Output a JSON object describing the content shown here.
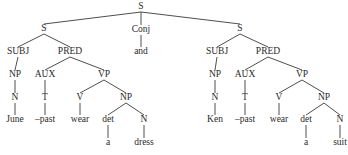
{
  "nodes": [
    {
      "id": "root",
      "label": "S",
      "x": 141,
      "y": 7
    },
    {
      "id": "s1",
      "label": "S",
      "x": 44,
      "y": 29
    },
    {
      "id": "conj",
      "label": "Conj",
      "x": 141,
      "y": 30
    },
    {
      "id": "and",
      "label": "and",
      "x": 141,
      "y": 52
    },
    {
      "id": "s2",
      "label": "S",
      "x": 240,
      "y": 29
    },
    {
      "id": "subj1",
      "label": "SUBJ",
      "x": 18,
      "y": 52
    },
    {
      "id": "pred1",
      "label": "PRED",
      "x": 70,
      "y": 52
    },
    {
      "id": "np1",
      "label": "NP",
      "x": 15,
      "y": 75
    },
    {
      "id": "aux1",
      "label": "AUX",
      "x": 45,
      "y": 75
    },
    {
      "id": "vp1",
      "label": "VP",
      "x": 104,
      "y": 75
    },
    {
      "id": "n1",
      "label": "N",
      "x": 15,
      "y": 98
    },
    {
      "id": "t1",
      "label": "T",
      "x": 45,
      "y": 98
    },
    {
      "id": "v1",
      "label": "V",
      "x": 80,
      "y": 98
    },
    {
      "id": "np1b",
      "label": "NP",
      "x": 126,
      "y": 98
    },
    {
      "id": "june",
      "label": "June",
      "x": 15,
      "y": 120
    },
    {
      "id": "past1",
      "label": "–past",
      "x": 45,
      "y": 120
    },
    {
      "id": "wear1",
      "label": "wear",
      "x": 80,
      "y": 120
    },
    {
      "id": "det1",
      "label": "det",
      "x": 108,
      "y": 120
    },
    {
      "id": "nn1",
      "label": "N",
      "x": 144,
      "y": 120
    },
    {
      "id": "a1",
      "label": "a",
      "x": 108,
      "y": 143
    },
    {
      "id": "dress",
      "label": "dress",
      "x": 144,
      "y": 143
    },
    {
      "id": "subj2",
      "label": "SUBJ",
      "x": 217,
      "y": 52
    },
    {
      "id": "pred2",
      "label": "PRED",
      "x": 268,
      "y": 52
    },
    {
      "id": "np2",
      "label": "NP",
      "x": 215,
      "y": 75
    },
    {
      "id": "aux2",
      "label": "AUX",
      "x": 245,
      "y": 75
    },
    {
      "id": "vp2",
      "label": "VP",
      "x": 302,
      "y": 75
    },
    {
      "id": "n2",
      "label": "N",
      "x": 215,
      "y": 98
    },
    {
      "id": "t2",
      "label": "T",
      "x": 245,
      "y": 98
    },
    {
      "id": "v2",
      "label": "V",
      "x": 279,
      "y": 98
    },
    {
      "id": "np2b",
      "label": "NP",
      "x": 324,
      "y": 98
    },
    {
      "id": "ken",
      "label": "Ken",
      "x": 215,
      "y": 120
    },
    {
      "id": "past2",
      "label": "–past",
      "x": 245,
      "y": 120
    },
    {
      "id": "wear2",
      "label": "wear",
      "x": 279,
      "y": 120
    },
    {
      "id": "det2",
      "label": "det",
      "x": 306,
      "y": 120
    },
    {
      "id": "nn2",
      "label": "N",
      "x": 340,
      "y": 120
    },
    {
      "id": "a2",
      "label": "a",
      "x": 306,
      "y": 143
    },
    {
      "id": "suit",
      "label": "suit",
      "x": 340,
      "y": 143
    }
  ],
  "edges": [
    [
      "root",
      "s1"
    ],
    [
      "root",
      "conj"
    ],
    [
      "root",
      "s2"
    ],
    [
      "conj",
      "and"
    ],
    [
      "s1",
      "subj1"
    ],
    [
      "s1",
      "pred1"
    ],
    [
      "subj1",
      "np1"
    ],
    [
      "pred1",
      "aux1"
    ],
    [
      "pred1",
      "vp1"
    ],
    [
      "np1",
      "n1"
    ],
    [
      "aux1",
      "t1"
    ],
    [
      "vp1",
      "v1"
    ],
    [
      "vp1",
      "np1b"
    ],
    [
      "n1",
      "june"
    ],
    [
      "t1",
      "past1"
    ],
    [
      "v1",
      "wear1"
    ],
    [
      "np1b",
      "det1"
    ],
    [
      "np1b",
      "nn1"
    ],
    [
      "det1",
      "a1"
    ],
    [
      "nn1",
      "dress"
    ],
    [
      "s2",
      "subj2"
    ],
    [
      "s2",
      "pred2"
    ],
    [
      "subj2",
      "np2"
    ],
    [
      "pred2",
      "aux2"
    ],
    [
      "pred2",
      "vp2"
    ],
    [
      "np2",
      "n2"
    ],
    [
      "aux2",
      "t2"
    ],
    [
      "vp2",
      "v2"
    ],
    [
      "vp2",
      "np2b"
    ],
    [
      "n2",
      "ken"
    ],
    [
      "t2",
      "past2"
    ],
    [
      "v2",
      "wear2"
    ],
    [
      "np2b",
      "det2"
    ],
    [
      "np2b",
      "nn2"
    ],
    [
      "det2",
      "a2"
    ],
    [
      "nn2",
      "suit"
    ]
  ]
}
